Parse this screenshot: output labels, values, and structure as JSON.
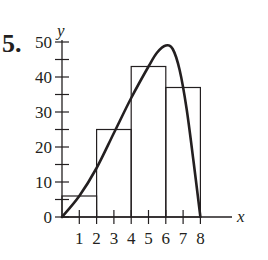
{
  "problem_number": "5.",
  "chart_data": {
    "type": "bar",
    "title": "",
    "xlabel": "x",
    "ylabel": "y",
    "xlim": [
      0,
      8
    ],
    "ylim": [
      0,
      50
    ],
    "grid": false,
    "x_ticks": [
      1,
      2,
      3,
      4,
      5,
      6,
      7,
      8
    ],
    "x_tick_labels": [
      "1",
      "2",
      "3",
      "4",
      "5",
      "6",
      "7",
      "8"
    ],
    "y_ticks_major": [
      0,
      10,
      20,
      30,
      40,
      50
    ],
    "y_tick_labels": [
      "0",
      "10",
      "20",
      "30",
      "40",
      "50"
    ],
    "y_ticks_minor": [
      5,
      15,
      25,
      35,
      45
    ],
    "bars": [
      {
        "x_start": 0,
        "x_end": 2,
        "height": 6
      },
      {
        "x_start": 2,
        "x_end": 4,
        "height": 25
      },
      {
        "x_start": 4,
        "x_end": 6,
        "height": 43
      },
      {
        "x_start": 6,
        "x_end": 8,
        "height": 37
      }
    ],
    "curve": {
      "description": "smooth curve rising from (0,0), peaking near (6,49), falling steeply to (8,0)",
      "points": [
        [
          0,
          0
        ],
        [
          1,
          6
        ],
        [
          2,
          14
        ],
        [
          3,
          24
        ],
        [
          4,
          34
        ],
        [
          5,
          43
        ],
        [
          5.5,
          47
        ],
        [
          6,
          49
        ],
        [
          6.4,
          48
        ],
        [
          6.8,
          42
        ],
        [
          7.2,
          31
        ],
        [
          7.6,
          16
        ],
        [
          8,
          0
        ]
      ]
    },
    "colors": {
      "line": "#231f20",
      "background": "#ffffff"
    }
  }
}
